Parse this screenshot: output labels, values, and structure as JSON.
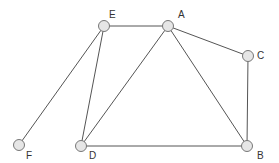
{
  "graph": {
    "nodes": [
      {
        "id": "E",
        "label": "E",
        "x": 104,
        "y": 26,
        "lx": 109,
        "ly": 10
      },
      {
        "id": "A",
        "label": "A",
        "x": 168,
        "y": 26,
        "lx": 178,
        "ly": 10
      },
      {
        "id": "C",
        "label": "C",
        "x": 248,
        "y": 56,
        "lx": 257,
        "ly": 51
      },
      {
        "id": "B",
        "label": "B",
        "x": 247,
        "y": 146,
        "lx": 257,
        "ly": 151
      },
      {
        "id": "D",
        "label": "D",
        "x": 81,
        "y": 146,
        "lx": 89,
        "ly": 151
      },
      {
        "id": "F",
        "label": "F",
        "x": 19,
        "y": 145,
        "lx": 26,
        "ly": 151
      }
    ],
    "edges": [
      [
        "E",
        "A"
      ],
      [
        "E",
        "D"
      ],
      [
        "E",
        "F"
      ],
      [
        "A",
        "D"
      ],
      [
        "A",
        "B"
      ],
      [
        "A",
        "C"
      ],
      [
        "C",
        "B"
      ],
      [
        "D",
        "B"
      ]
    ],
    "colors": {
      "edge": "#555555",
      "node_fill": "#e6e6e6",
      "node_stroke": "#777777",
      "label": "#333333"
    }
  }
}
